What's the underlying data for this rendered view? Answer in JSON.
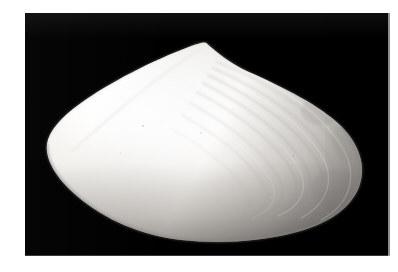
{
  "page": {
    "type": "photograph",
    "canvas_width": 398,
    "canvas_height": 272,
    "page_background_color": "#ffffff"
  },
  "photo": {
    "subject": "bivalve-mollusk-shell",
    "subject_common_name": "clam shell",
    "view": "exterior lateral view of single valve",
    "background_color": "#000000",
    "specimen_color_light": "#ffffff",
    "specimen_color_mid": "#dedad3",
    "specimen_color_shadow": "#9a9792",
    "frame_left": 25,
    "frame_top": 13,
    "frame_width": 365,
    "frame_height": 243,
    "caption": ""
  },
  "specimen": {
    "umbo_label": "umbo",
    "anterior_label": "anterior tip",
    "posterior_label": "posterior margin",
    "ventral_label": "ventral margin",
    "growth_lines_label": "concentric growth lines",
    "growth_line_count": 9,
    "lighting": "key light from upper left, falloff toward lower right"
  },
  "annotations": {
    "visible_text": []
  }
}
